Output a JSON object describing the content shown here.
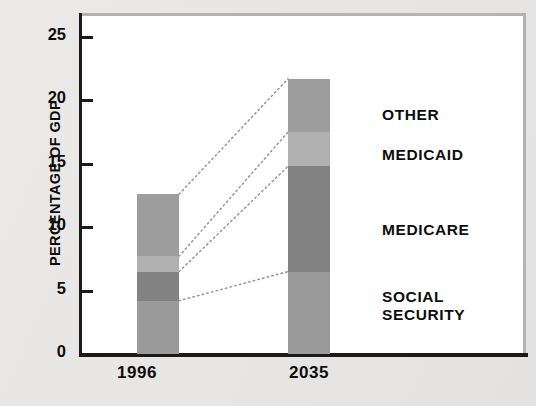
{
  "chart_data": {
    "type": "bar",
    "title": "",
    "subtitle": "",
    "xlabel": "",
    "ylabel": "PERCENTAGE OF GDP",
    "categories": [
      "1996",
      "2035"
    ],
    "ylim": [
      0,
      27
    ],
    "yticks": [
      0,
      5,
      10,
      15,
      20,
      25
    ],
    "ytick_labels": [
      "0",
      "5",
      "10",
      "15",
      "20",
      "25"
    ],
    "grid": false,
    "stacked": true,
    "legend_position": "inline-right-callouts",
    "series": [
      {
        "name": "SOCIAL SECURITY",
        "color": "#9a9a9a",
        "values": [
          4.2,
          6.5
        ]
      },
      {
        "name": "MEDICARE",
        "color": "#828282",
        "values": [
          2.3,
          8.3
        ]
      },
      {
        "name": "MEDICAID",
        "color": "#b0b0b0",
        "values": [
          1.2,
          2.7
        ]
      },
      {
        "name": "OTHER",
        "color": "#9d9d9d",
        "values": [
          4.9,
          4.2
        ]
      }
    ],
    "totals": [
      12.6,
      21.7
    ],
    "annotations": [
      "Dotted leader lines connect each 1996 stack boundary to the matching 2035 stack boundary"
    ]
  },
  "axis": {
    "y_title": "PERCENTAGE OF GDP",
    "ticks": [
      {
        "label": "25",
        "value": 25
      },
      {
        "label": "20",
        "value": 20
      },
      {
        "label": "15",
        "value": 15
      },
      {
        "label": "10",
        "value": 10
      },
      {
        "label": "5",
        "value": 5
      },
      {
        "label": "0",
        "value": 0
      }
    ]
  },
  "categories": [
    {
      "label": "1996"
    },
    {
      "label": "2035"
    }
  ],
  "callouts": [
    {
      "label": "OTHER"
    },
    {
      "label": "MEDICAID"
    },
    {
      "label": "MEDICARE"
    },
    {
      "label": "SOCIAL\nSECURITY"
    }
  ],
  "colors": {
    "social_security": "#9a9a9a",
    "medicare": "#828282",
    "medicaid": "#b0b0b0",
    "other": "#9d9d9d",
    "axis": "#1a1a1a",
    "frame": "#b4b3b1",
    "plot_background": "#ffffff",
    "page_background": "#e9e8e6",
    "leader_line": "#8f8f8f"
  }
}
